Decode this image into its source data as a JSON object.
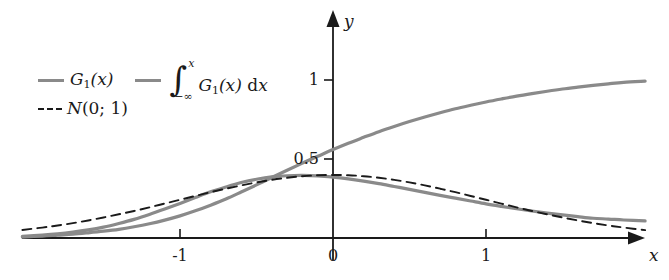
{
  "figure": {
    "background": "#ffffff",
    "curve_color": "#8a8a8a",
    "axis_color": "#1a1a1a",
    "dashed_color": "#1a1a1a"
  },
  "legend": {
    "entries": [
      {
        "id": "density",
        "style": "solid",
        "color": "#8a8a8a",
        "label_plain": "G_1(x)",
        "base": "G",
        "subscript": "1",
        "arg": "(x)"
      },
      {
        "id": "integral",
        "style": "solid",
        "color": "#8a8a8a",
        "label_plain": "∫_{-∞}^{x} G_1(x) dx",
        "int_sign": "∫",
        "upper_limit": "x",
        "lower_limit": "−∞",
        "base": "G",
        "subscript": "1",
        "arg": "(x)",
        "differential_d": "d",
        "differential_var": "x"
      },
      {
        "id": "normal",
        "style": "dashed",
        "color": "#1a1a1a",
        "label_plain": "N(0; 1)",
        "base": "N",
        "arg": "(0; 1)"
      }
    ]
  },
  "axes": {
    "x_name": "x",
    "y_name": "y",
    "x_ticks": [
      {
        "value": -1,
        "label": "-1"
      },
      {
        "value": 0,
        "label": "0"
      },
      {
        "value": 1,
        "label": "1"
      }
    ],
    "y_ticks": [
      {
        "value": 0.5,
        "label": "0.5"
      },
      {
        "value": 1,
        "label": "1"
      }
    ],
    "x_range": [
      -2.03,
      2.04
    ],
    "y_range": [
      0,
      1.46
    ],
    "grid": false
  },
  "chart_data": {
    "type": "line",
    "title": "",
    "xlabel": "x",
    "ylabel": "y",
    "xlim": [
      -2.03,
      2.04
    ],
    "ylim": [
      0,
      1.46
    ],
    "grid": false,
    "legend_position": "upper-left",
    "x": [
      -2.03,
      -1.9,
      -1.8,
      -1.7,
      -1.6,
      -1.5,
      -1.4,
      -1.3,
      -1.2,
      -1.1,
      -1.0,
      -0.9,
      -0.8,
      -0.7,
      -0.6,
      -0.5,
      -0.4,
      -0.3,
      -0.2,
      -0.1,
      0.0,
      0.1,
      0.2,
      0.3,
      0.4,
      0.5,
      0.6,
      0.7,
      0.8,
      0.9,
      1.0,
      1.1,
      1.2,
      1.3,
      1.4,
      1.5,
      1.6,
      1.7,
      1.8,
      1.9,
      2.04
    ],
    "series": [
      {
        "name": "G_1(x)",
        "style": "solid",
        "color": "#8a8a8a",
        "values": [
          0.01,
          0.018,
          0.026,
          0.037,
          0.051,
          0.069,
          0.092,
          0.118,
          0.149,
          0.183,
          0.219,
          0.256,
          0.292,
          0.323,
          0.351,
          0.372,
          0.387,
          0.394,
          0.396,
          0.393,
          0.385,
          0.374,
          0.36,
          0.344,
          0.326,
          0.308,
          0.289,
          0.27,
          0.252,
          0.234,
          0.216,
          0.2,
          0.185,
          0.171,
          0.158,
          0.146,
          0.135,
          0.125,
          0.12,
          0.114,
          0.108
        ]
      },
      {
        "name": "∫_{-∞}^{x} G_1(x) dx",
        "style": "solid",
        "color": "#8a8a8a",
        "values": [
          0.006,
          0.012,
          0.018,
          0.024,
          0.033,
          0.043,
          0.055,
          0.071,
          0.09,
          0.113,
          0.14,
          0.172,
          0.208,
          0.247,
          0.291,
          0.336,
          0.383,
          0.429,
          0.474,
          0.517,
          0.56,
          0.6,
          0.637,
          0.673,
          0.706,
          0.737,
          0.766,
          0.793,
          0.818,
          0.84,
          0.861,
          0.88,
          0.898,
          0.914,
          0.929,
          0.943,
          0.955,
          0.966,
          0.976,
          0.985,
          0.993
        ]
      },
      {
        "name": "N(0; 1)",
        "style": "dashed",
        "color": "#1a1a1a",
        "values": [
          0.051,
          0.066,
          0.079,
          0.094,
          0.111,
          0.13,
          0.15,
          0.171,
          0.194,
          0.218,
          0.242,
          0.266,
          0.29,
          0.312,
          0.333,
          0.352,
          0.368,
          0.381,
          0.391,
          0.397,
          0.399,
          0.397,
          0.391,
          0.381,
          0.368,
          0.352,
          0.333,
          0.312,
          0.29,
          0.266,
          0.242,
          0.218,
          0.194,
          0.171,
          0.15,
          0.13,
          0.111,
          0.094,
          0.079,
          0.066,
          0.05
        ]
      }
    ]
  }
}
